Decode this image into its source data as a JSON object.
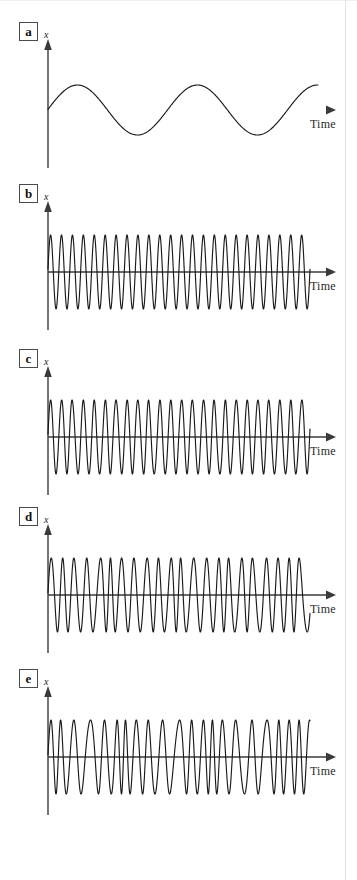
{
  "figure": {
    "background": "#ffffff",
    "stroke_color": "#1a1a1a",
    "axis_color": "#3a3a3a",
    "label_box_color": "#4a4a4a"
  },
  "panels": [
    {
      "id": "a",
      "label": "a",
      "y_axis_label": "x",
      "x_axis_label": "Time",
      "baseline_y": 110,
      "axis_fade": true,
      "description": "slow clean sinusoid, low frequency, constant amplitude"
    },
    {
      "id": "b",
      "label": "b",
      "y_axis_label": "x",
      "x_axis_label": "Time",
      "baseline_y": 272,
      "axis_fade": false,
      "description": "uniform high-frequency sinusoid, constant period and amplitude"
    },
    {
      "id": "c",
      "label": "c",
      "y_axis_label": "x",
      "x_axis_label": "Time",
      "baseline_y": 437,
      "axis_fade": false,
      "description": "high-frequency oscillation with mild period jitter"
    },
    {
      "id": "d",
      "label": "d",
      "y_axis_label": "x",
      "x_axis_label": "Time",
      "baseline_y": 595,
      "axis_fade": false,
      "description": "oscillation with moderate frequency modulation, occasional slow cycles"
    },
    {
      "id": "e",
      "label": "e",
      "y_axis_label": "x",
      "x_axis_label": "Time",
      "baseline_y": 757,
      "axis_fade": false,
      "description": "oscillation with strong frequency modulation, alternating fast bursts and slow cycles"
    }
  ],
  "chart_data": {
    "type": "line",
    "title": "",
    "xlabel": "Time",
    "ylabel": "x",
    "grid": false,
    "legend": "none",
    "axis": {
      "x_origin": 48,
      "x_end_wave": 310,
      "x_end_arrow": 328,
      "y_amplitude_px": 37,
      "y_axis_top_offset": -62,
      "y_axis_bottom_offset": 58
    },
    "panels": [
      {
        "id": "a",
        "label": "a",
        "waveform": "sine",
        "cycles": 2.25,
        "amplitude": 1.0,
        "amplitude_px": 25,
        "frequency_variation": 0.0,
        "phase": 0,
        "samples": 500,
        "wave_x_start": 48,
        "wave_x_end": 318
      },
      {
        "id": "b",
        "label": "b",
        "waveform": "sine",
        "cycles": 24,
        "amplitude": 1.0,
        "amplitude_px": 37,
        "frequency_variation": 0.0,
        "phase": 0,
        "samples": 2000,
        "wave_x_start": 48,
        "wave_x_end": 310
      },
      {
        "id": "c",
        "label": "c",
        "waveform": "fm-sine",
        "cycles": 24,
        "amplitude": 1.0,
        "amplitude_px": 37,
        "frequency_variation": 0.18,
        "modulation_cycles": 5.5,
        "modulation_seed": 3,
        "phase": 0,
        "samples": 2000,
        "wave_x_start": 48,
        "wave_x_end": 310
      },
      {
        "id": "d",
        "label": "d",
        "waveform": "fm-sine",
        "cycles": 22,
        "amplitude": 1.0,
        "amplitude_px": 37,
        "frequency_variation": 0.42,
        "modulation_cycles": 4.0,
        "modulation_seed": 7,
        "phase": 0,
        "samples": 2000,
        "wave_x_start": 48,
        "wave_x_end": 310
      },
      {
        "id": "e",
        "label": "e",
        "waveform": "fm-sine",
        "cycles": 21,
        "amplitude": 1.0,
        "amplitude_px": 37,
        "frequency_variation": 0.62,
        "modulation_cycles": 3.0,
        "modulation_seed": 11,
        "phase": 0,
        "samples": 2000,
        "wave_x_start": 48,
        "wave_x_end": 310
      }
    ]
  }
}
